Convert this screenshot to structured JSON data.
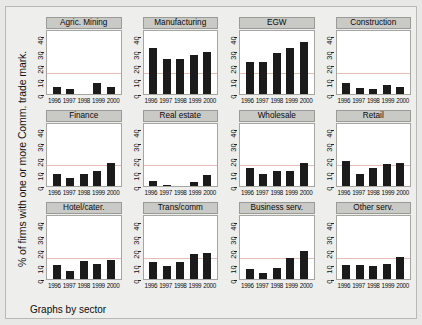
{
  "chart_data": {
    "type": "bar",
    "title": "",
    "ylabel": "% of firms with one or more Comm. trade mark.",
    "xlabel": "",
    "footer": "Graphs by sector",
    "categories": [
      "1996",
      "1997",
      "1998",
      "1999",
      "2000"
    ],
    "ylim": [
      0,
      45
    ],
    "yticks": [
      0,
      10,
      20,
      30,
      40
    ],
    "ytick_labels": [
      "0",
      "10",
      "20",
      "30",
      "40"
    ],
    "grid": false,
    "legend": "none",
    "reference_line": 15,
    "layout": "3 rows x 4 columns of small-multiple panels",
    "panels": [
      {
        "label": "Agric. Mining",
        "values": [
          5,
          3,
          0,
          8,
          5
        ]
      },
      {
        "label": "Manufacturing",
        "values": [
          33,
          25,
          25,
          28,
          30
        ]
      },
      {
        "label": "EGW",
        "values": [
          23,
          23,
          29,
          33,
          37
        ]
      },
      {
        "label": "Construction",
        "values": [
          8,
          4,
          3,
          6,
          5
        ]
      },
      {
        "label": "Finance",
        "values": [
          9,
          6,
          9,
          11,
          17
        ]
      },
      {
        "label": "Real estate",
        "values": [
          4,
          1,
          0,
          3,
          8
        ]
      },
      {
        "label": "Wholesale",
        "values": [
          13,
          9,
          11,
          11,
          17
        ]
      },
      {
        "label": "Retail",
        "values": [
          18,
          9,
          13,
          16,
          17
        ]
      },
      {
        "label": "Hotel/cater.",
        "values": [
          10,
          6,
          13,
          11,
          14
        ]
      },
      {
        "label": "Trans/comm",
        "values": [
          12,
          9,
          12,
          18,
          19
        ]
      },
      {
        "label": "Business serv.",
        "values": [
          7,
          4,
          8,
          15,
          20
        ]
      },
      {
        "label": "Other serv.",
        "values": [
          10,
          10,
          9,
          11,
          16
        ]
      }
    ],
    "colors": {
      "bar": "#1b1b1b",
      "panel_strip": "#c9c9c5",
      "background": "#eeeeec",
      "plot_background": "#ffffff",
      "reference_line": "#e0b3a8"
    }
  }
}
